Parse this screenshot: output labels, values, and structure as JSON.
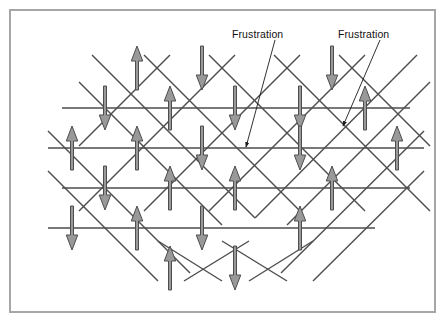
{
  "figure": {
    "background_color": "#ffffff",
    "frame_color": "#a6a6a6",
    "line_color": "#4d4d4d",
    "arrow_fill": "#999999",
    "arrow_stroke": "#4d4d4d",
    "text_color": "#111111"
  },
  "annotations": [
    {
      "id": "frustration-label-1",
      "text": "Frustration",
      "x": 232,
      "y": 28,
      "leader": {
        "from_x": 275,
        "from_y": 40,
        "to_x": 246,
        "to_y": 147
      }
    },
    {
      "id": "frustration-label-2",
      "text": "Frustration",
      "x": 338,
      "y": 28,
      "leader": {
        "from_x": 380,
        "from_y": 40,
        "to_x": 343,
        "to_y": 126
      }
    }
  ],
  "lattice": {
    "description": "Square lattice rotated 45 degrees with horizontal rows; spins sit on vertices.",
    "horizontal_rows_y": [
      108,
      148,
      188,
      228
    ],
    "horizontal_rows_x_extent": [
      [
        62,
        410
      ],
      [
        48,
        424
      ],
      [
        62,
        410
      ],
      [
        48,
        375
      ]
    ],
    "spacing_x": 65,
    "spacing_y": 40,
    "spins": [
      {
        "x": 137,
        "y": 68,
        "dir": "up"
      },
      {
        "x": 202,
        "y": 68,
        "dir": "down"
      },
      {
        "x": 332,
        "y": 68,
        "dir": "down"
      },
      {
        "x": 105,
        "y": 108,
        "dir": "down"
      },
      {
        "x": 170,
        "y": 108,
        "dir": "up"
      },
      {
        "x": 235,
        "y": 108,
        "dir": "down"
      },
      {
        "x": 300,
        "y": 108,
        "dir": "down"
      },
      {
        "x": 365,
        "y": 108,
        "dir": "up"
      },
      {
        "x": 72,
        "y": 148,
        "dir": "up"
      },
      {
        "x": 137,
        "y": 148,
        "dir": "up"
      },
      {
        "x": 202,
        "y": 148,
        "dir": "down"
      },
      {
        "x": 300,
        "y": 148,
        "dir": "down"
      },
      {
        "x": 397,
        "y": 148,
        "dir": "up"
      },
      {
        "x": 105,
        "y": 188,
        "dir": "down"
      },
      {
        "x": 170,
        "y": 188,
        "dir": "up"
      },
      {
        "x": 235,
        "y": 188,
        "dir": "up"
      },
      {
        "x": 332,
        "y": 188,
        "dir": "up"
      },
      {
        "x": 72,
        "y": 228,
        "dir": "down"
      },
      {
        "x": 137,
        "y": 228,
        "dir": "up"
      },
      {
        "x": 202,
        "y": 228,
        "dir": "down"
      },
      {
        "x": 300,
        "y": 228,
        "dir": "up"
      },
      {
        "x": 170,
        "y": 268,
        "dir": "up"
      },
      {
        "x": 235,
        "y": 268,
        "dir": "down"
      }
    ],
    "diagonals_down_right": [
      {
        "x1": 79,
        "y1": 82,
        "x2": 222,
        "y2": 225
      },
      {
        "x1": 92,
        "y1": 55,
        "x2": 255,
        "y2": 218
      },
      {
        "x1": 144,
        "y1": 55,
        "x2": 300,
        "y2": 211
      },
      {
        "x1": 209,
        "y1": 55,
        "x2": 365,
        "y2": 211
      },
      {
        "x1": 274,
        "y1": 55,
        "x2": 430,
        "y2": 211
      },
      {
        "x1": 339,
        "y1": 55,
        "x2": 430,
        "y2": 146
      },
      {
        "x1": 48,
        "y1": 131,
        "x2": 190,
        "y2": 273
      },
      {
        "x1": 48,
        "y1": 171,
        "x2": 158,
        "y2": 281
      },
      {
        "x1": 158,
        "y1": 241,
        "x2": 222,
        "y2": 281
      },
      {
        "x1": 222,
        "y1": 241,
        "x2": 287,
        "y2": 281
      }
    ],
    "diagonals_down_left": [
      {
        "x1": 430,
        "y1": 82,
        "x2": 287,
        "y2": 225
      },
      {
        "x1": 417,
        "y1": 55,
        "x2": 255,
        "y2": 218
      },
      {
        "x1": 365,
        "y1": 55,
        "x2": 209,
        "y2": 211
      },
      {
        "x1": 300,
        "y1": 55,
        "x2": 144,
        "y2": 211
      },
      {
        "x1": 235,
        "y1": 55,
        "x2": 79,
        "y2": 211
      },
      {
        "x1": 170,
        "y1": 55,
        "x2": 79,
        "y2": 146
      },
      {
        "x1": 424,
        "y1": 131,
        "x2": 281,
        "y2": 273
      },
      {
        "x1": 424,
        "y1": 171,
        "x2": 313,
        "y2": 281
      },
      {
        "x1": 313,
        "y1": 241,
        "x2": 249,
        "y2": 281
      },
      {
        "x1": 249,
        "y1": 241,
        "x2": 184,
        "y2": 281
      }
    ]
  }
}
